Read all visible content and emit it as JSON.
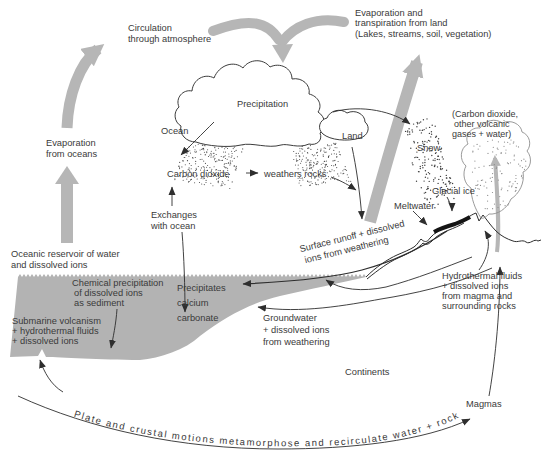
{
  "labels": {
    "circulation": [
      "Circulation",
      "through atmosphere"
    ],
    "evaporation_transpiration": [
      "Evaporation and",
      "transpiration from land",
      "(Lakes, streams, soil, vegetation)"
    ],
    "evaporation_oceans": [
      "Evaporation",
      "from oceans"
    ],
    "precipitation": "Precipitation",
    "ocean": "Ocean",
    "land": "Land",
    "carbon_dioxide": "Carbon dioxide",
    "weathers_rocks": "weathers rocks",
    "exchanges_with_ocean": [
      "Exchanges",
      "with ocean"
    ],
    "oceanic_reservoir": [
      "Oceanic reservoir of water",
      "and dissolved ions"
    ],
    "snow": "Snow",
    "volcanic_gases": [
      "(Carbon dioxide,",
      "other volcanic",
      "gases + water)"
    ],
    "glacial_ice": "Glacial ice",
    "meltwater": "Meltwater",
    "surface_runoff": [
      "Surface runoff + dissolved",
      "ions from weathering"
    ],
    "chemical_precipitation": [
      "Chemical precipitation",
      "of dissolved ions",
      "as sediment"
    ],
    "precipitates_calcium": [
      "Precipitates",
      "calcium",
      "carbonate"
    ],
    "submarine_volcanism": [
      "Submarine volcanism",
      "+ hydrothermal fluids",
      "+ dissolved ions"
    ],
    "groundwater": [
      "Groundwater",
      "+ dissolved ions",
      "from weathering"
    ],
    "hydrothermal_fluids": [
      "Hydrothermal fluids",
      "+ dissolved ions",
      "from magma and",
      "surrounding rocks"
    ],
    "continents": "Continents",
    "magmas": "Magmas",
    "plate_motions": "Plate and crustal motions metamorphose and recirculate water + rock"
  },
  "colors": {
    "background": "#ffffff",
    "ocean_fill": "#b3b3b3",
    "arrow_gray": "#b6b6b6",
    "line": "#2e2e2e",
    "text": "#3a3a3a",
    "glacial_ice": "#141414"
  }
}
